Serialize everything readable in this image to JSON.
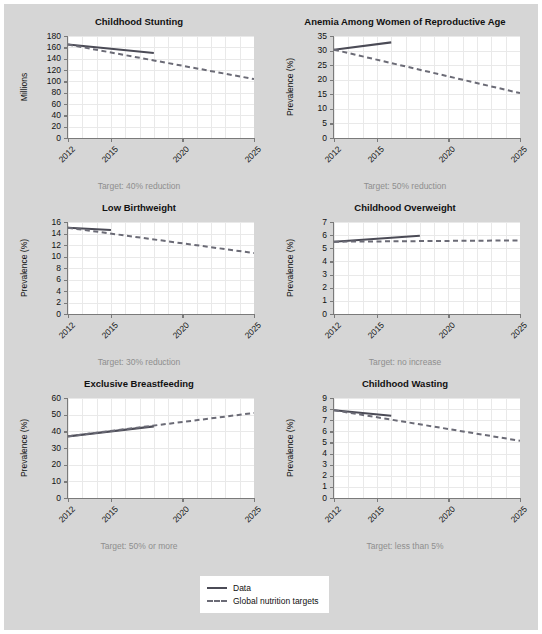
{
  "figure": {
    "background_color": "#d6d6d6",
    "plot_background_color": "#ffffff",
    "data_color": "#4b4b56",
    "target_color": "#6b6b76",
    "grid_color": "#e9e9e9"
  },
  "legend": {
    "items": [
      {
        "label": "Data",
        "style": "solid"
      },
      {
        "label": "Global nutrition targets",
        "style": "dashed"
      }
    ]
  },
  "chart_data": [
    {
      "type": "line",
      "title": "Childhood Stunting",
      "xlabel": "",
      "ylabel": "Millions",
      "xlim": [
        2012,
        2025
      ],
      "ylim": [
        0,
        180
      ],
      "yticks": [
        0,
        20,
        40,
        60,
        80,
        100,
        120,
        140,
        160,
        180
      ],
      "xticks": [
        2012,
        2015,
        2020,
        2025
      ],
      "grid": true,
      "annotation": "Target: 40% reduction",
      "series": [
        {
          "name": "Data",
          "style": "solid",
          "x": [
            2012,
            2018
          ],
          "values": [
            165,
            150
          ]
        },
        {
          "name": "Global nutrition targets",
          "style": "dashed",
          "x": [
            2012,
            2025
          ],
          "values": [
            165,
            104
          ]
        }
      ]
    },
    {
      "type": "line",
      "title": "Anemia Among Women of Reproductive Age",
      "xlabel": "",
      "ylabel": "Prevalence (%)",
      "xlim": [
        2012,
        2025
      ],
      "ylim": [
        0,
        35
      ],
      "yticks": [
        0,
        5,
        10,
        15,
        20,
        25,
        30,
        35
      ],
      "xticks": [
        2012,
        2015,
        2020,
        2025
      ],
      "grid": true,
      "annotation": "Target: 50% reduction",
      "series": [
        {
          "name": "Data",
          "style": "solid",
          "x": [
            2012,
            2016
          ],
          "values": [
            30.3,
            32.8
          ]
        },
        {
          "name": "Global nutrition targets",
          "style": "dashed",
          "x": [
            2012,
            2025
          ],
          "values": [
            30.3,
            15.4
          ]
        }
      ]
    },
    {
      "type": "line",
      "title": "Low Birthweight",
      "xlabel": "",
      "ylabel": "Prevalence (%)",
      "xlim": [
        2012,
        2025
      ],
      "ylim": [
        0,
        16
      ],
      "yticks": [
        0,
        2,
        4,
        6,
        8,
        10,
        12,
        14,
        16
      ],
      "xticks": [
        2012,
        2015,
        2020,
        2025
      ],
      "grid": true,
      "annotation": "Target: 30% reduction",
      "series": [
        {
          "name": "Data",
          "style": "solid",
          "x": [
            2012,
            2015
          ],
          "values": [
            15.0,
            14.6
          ]
        },
        {
          "name": "Global nutrition targets",
          "style": "dashed",
          "x": [
            2012,
            2025
          ],
          "values": [
            15.0,
            10.6
          ]
        }
      ]
    },
    {
      "type": "line",
      "title": "Childhood Overweight",
      "xlabel": "",
      "ylabel": "Prevalence (%)",
      "xlim": [
        2012,
        2025
      ],
      "ylim": [
        0,
        7
      ],
      "yticks": [
        0,
        1,
        2,
        3,
        4,
        5,
        6,
        7
      ],
      "xticks": [
        2012,
        2015,
        2020,
        2025
      ],
      "grid": true,
      "annotation": "Target: no increase",
      "series": [
        {
          "name": "Data",
          "style": "solid",
          "x": [
            2012,
            2018
          ],
          "values": [
            5.5,
            5.95
          ]
        },
        {
          "name": "Global nutrition targets",
          "style": "dashed",
          "x": [
            2012,
            2025
          ],
          "values": [
            5.5,
            5.6
          ]
        }
      ]
    },
    {
      "type": "line",
      "title": "Exclusive Breastfeeding",
      "xlabel": "",
      "ylabel": "Prevalence (%)",
      "xlim": [
        2012,
        2025
      ],
      "ylim": [
        0,
        60
      ],
      "yticks": [
        0,
        10,
        20,
        30,
        40,
        50,
        60
      ],
      "xticks": [
        2012,
        2015,
        2020,
        2025
      ],
      "grid": true,
      "annotation": "Target: 50% or more",
      "series": [
        {
          "name": "Data",
          "style": "solid",
          "x": [
            2012,
            2018
          ],
          "values": [
            37,
            43
          ]
        },
        {
          "name": "Global nutrition targets",
          "style": "dashed",
          "x": [
            2012,
            2025
          ],
          "values": [
            37,
            51
          ]
        }
      ]
    },
    {
      "type": "line",
      "title": "Childhood Wasting",
      "xlabel": "",
      "ylabel": "Prevalence (%)",
      "xlim": [
        2012,
        2025
      ],
      "ylim": [
        0,
        9
      ],
      "yticks": [
        0,
        1,
        2,
        3,
        4,
        5,
        6,
        7,
        8,
        9
      ],
      "xticks": [
        2012,
        2015,
        2020,
        2025
      ],
      "grid": true,
      "annotation": "Target: less than 5%",
      "series": [
        {
          "name": "Data",
          "style": "solid",
          "x": [
            2012,
            2016
          ],
          "values": [
            7.9,
            7.4
          ]
        },
        {
          "name": "Global nutrition targets",
          "style": "dashed",
          "x": [
            2012,
            2025
          ],
          "values": [
            7.9,
            5.15
          ]
        }
      ]
    }
  ]
}
